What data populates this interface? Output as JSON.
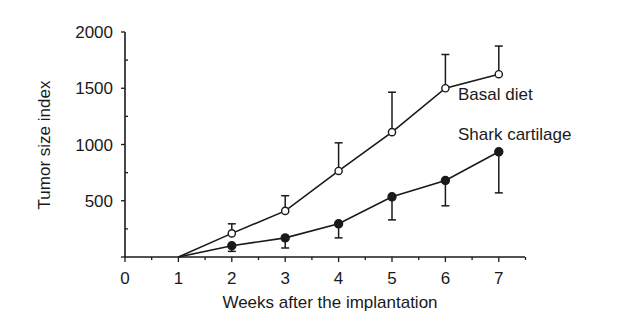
{
  "chart_data": {
    "type": "line",
    "title": "",
    "xlabel": "Weeks after the implantation",
    "ylabel": "Tumor size index",
    "x": [
      1,
      2,
      3,
      4,
      5,
      6,
      7
    ],
    "xlim": [
      0,
      7
    ],
    "ylim": [
      0,
      2000
    ],
    "x_ticks": [
      0,
      1,
      2,
      3,
      4,
      5,
      6,
      7
    ],
    "y_ticks": [
      500,
      1000,
      1500,
      2000
    ],
    "grid": false,
    "legend_position": "inline labels at right of lines",
    "series": [
      {
        "name": "Basal diet",
        "marker": "open-circle",
        "values": [
          0,
          210,
          410,
          765,
          1110,
          1500,
          1625
        ],
        "error_upper": [
          0,
          295,
          545,
          1015,
          1465,
          1800,
          1875
        ]
      },
      {
        "name": "Shark cartilage",
        "marker": "filled-circle",
        "values": [
          0,
          100,
          170,
          295,
          535,
          680,
          935
        ],
        "error_lower": [
          0,
          50,
          80,
          170,
          330,
          455,
          570
        ]
      }
    ]
  },
  "labels": {
    "xlabel": "Weeks after the implantation",
    "ylabel": "Tumor size index",
    "series_a": "Basal diet",
    "series_b": "Shark cartilage"
  },
  "ticks": {
    "x": [
      "0",
      "1",
      "2",
      "3",
      "4",
      "5",
      "6",
      "7"
    ],
    "y": [
      "500",
      "1000",
      "1500",
      "2000"
    ]
  }
}
